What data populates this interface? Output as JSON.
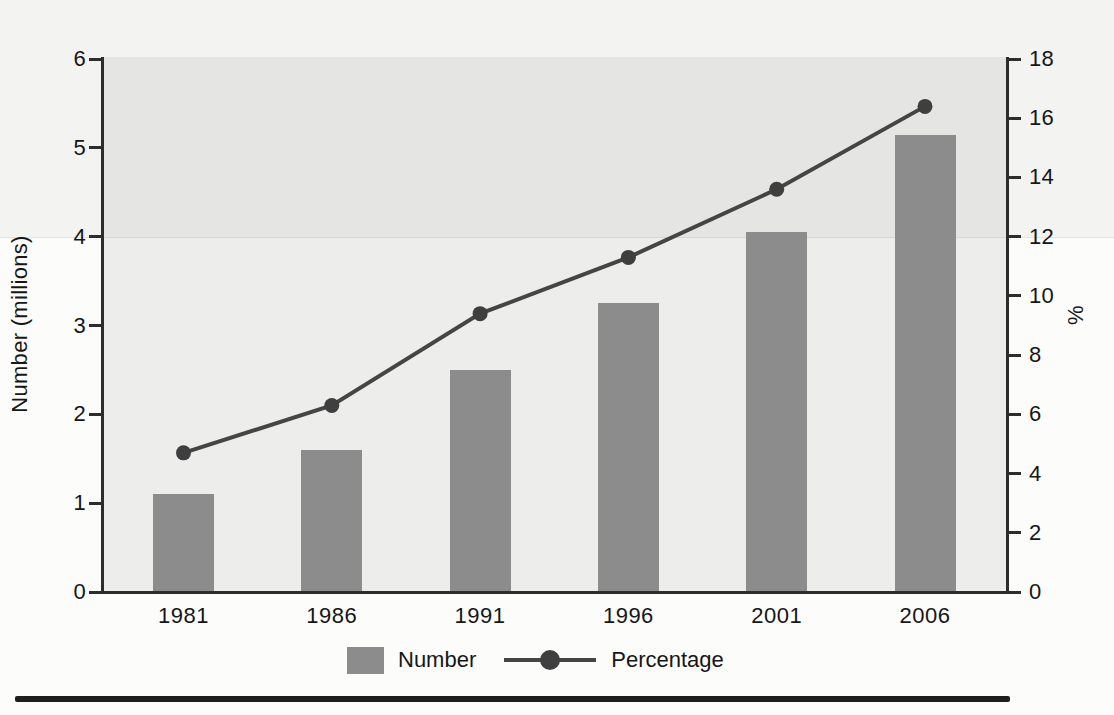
{
  "chart_data": {
    "type": "combo-bar-line",
    "categories": [
      "1981",
      "1986",
      "1991",
      "1996",
      "2001",
      "2006"
    ],
    "series": [
      {
        "name": "Number",
        "type": "bar",
        "axis": "left",
        "values": [
          1.1,
          1.6,
          2.5,
          3.25,
          4.05,
          5.15
        ]
      },
      {
        "name": "Percentage",
        "type": "line",
        "axis": "right",
        "values": [
          4.7,
          6.3,
          9.4,
          11.3,
          13.6,
          16.4
        ]
      }
    ],
    "left_axis": {
      "label": "Number (millions)",
      "min": 0,
      "max": 6,
      "ticks": [
        0,
        1,
        2,
        3,
        4,
        5,
        6
      ]
    },
    "right_axis": {
      "label": "%",
      "min": 0,
      "max": 18,
      "ticks": [
        0,
        2,
        4,
        6,
        8,
        10,
        12,
        14,
        16,
        18
      ]
    },
    "legend": {
      "position": "bottom",
      "items": [
        "Number",
        "Percentage"
      ]
    },
    "grid": false
  },
  "colors": {
    "bar": "#8c8c8c",
    "line": "#454545",
    "marker": "#3f3f3f",
    "axis": "#2d2d2d",
    "text": "#161616",
    "plot_background": "#ededec",
    "page_background": "#fcfcfa",
    "bottom_rule": "#1e1e1e"
  }
}
